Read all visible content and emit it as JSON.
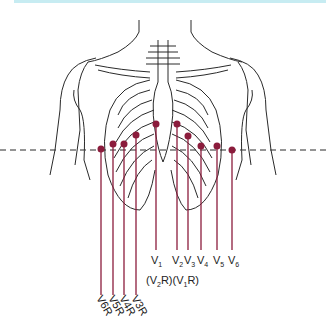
{
  "colors": {
    "electrode": "#8b1c3c",
    "outline": "#2a2a2a",
    "band": "#c7ecf2"
  },
  "left_leads": [
    {
      "label": "V",
      "sub": "1",
      "x": 156,
      "y": 124
    },
    {
      "label": "V",
      "sub": "2",
      "x": 177,
      "y": 124
    },
    {
      "label": "V",
      "sub": "3",
      "x": 188,
      "y": 136
    },
    {
      "label": "V",
      "sub": "4",
      "x": 201,
      "y": 146
    },
    {
      "label": "V",
      "sub": "5",
      "x": 217,
      "y": 146
    },
    {
      "label": "V",
      "sub": "6",
      "x": 232,
      "y": 150
    }
  ],
  "right_leads": [
    {
      "label": "V6R",
      "x": 101,
      "y": 149
    },
    {
      "label": "V5R",
      "x": 113,
      "y": 144
    },
    {
      "label": "V4R",
      "x": 124,
      "y": 144
    },
    {
      "label": "V3R",
      "x": 136,
      "y": 135
    }
  ],
  "bracket_labels": {
    "v2r": "(V2R)",
    "v1r": "(V1R)"
  },
  "label_text": {
    "v1": "V",
    "v1s": "1",
    "v2": "V",
    "v2s": "2",
    "v3": "V",
    "v3s": "3",
    "v4": "V",
    "v4s": "4",
    "v5": "V",
    "v5s": "5",
    "v6": "V",
    "v6s": "6",
    "p_open": "(V",
    "p_v2r_sub": "2",
    "p_close": "R)(V",
    "p_v1r_sub": "1",
    "p_end": "R)",
    "r6": "V6R",
    "r5": "V5R",
    "r4": "V4R",
    "r3": "V3R"
  }
}
